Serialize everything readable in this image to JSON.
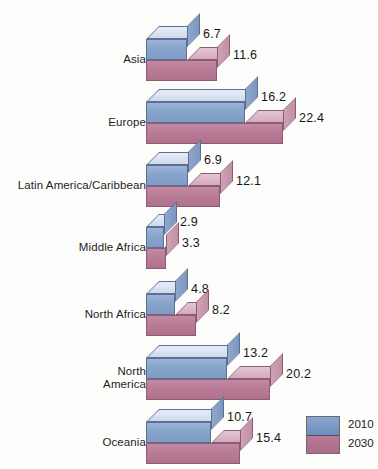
{
  "chart_data": {
    "type": "bar",
    "orientation": "horizontal",
    "title": "",
    "xlabel": "",
    "ylabel": "",
    "grid": false,
    "legend_position": "bottom-right",
    "categories": [
      "Asia",
      "Europe",
      "Latin America/Caribbean",
      "Middle Africa",
      "North Africa",
      "North\nAmerica",
      "Oceania"
    ],
    "series": [
      {
        "name": "2010",
        "color": "#7f9bc5",
        "values": [
          6.7,
          16.2,
          6.9,
          2.9,
          4.8,
          13.2,
          10.7
        ]
      },
      {
        "name": "2030",
        "color": "#b0718c",
        "values": [
          11.6,
          22.4,
          12.1,
          3.3,
          8.2,
          20.2,
          15.4
        ]
      }
    ],
    "xlim": [
      0,
      22.4
    ]
  },
  "legend": {
    "items": [
      {
        "label": "2010",
        "color": "#7f9bc5"
      },
      {
        "label": "2030",
        "color": "#b0718c"
      }
    ]
  },
  "groups": [
    {
      "label": "Asia",
      "v2010": "6.7",
      "v2030": "11.6"
    },
    {
      "label": "Europe",
      "v2010": "16.2",
      "v2030": "22.4"
    },
    {
      "label": "Latin America/Caribbean",
      "v2010": "6.9",
      "v2030": "12.1"
    },
    {
      "label": "Middle Africa",
      "v2010": "2.9",
      "v2030": "3.3"
    },
    {
      "label": "North Africa",
      "v2010": "4.8",
      "v2030": "8.2"
    },
    {
      "label": "North\nAmerica",
      "v2010": "13.2",
      "v2030": "20.2"
    },
    {
      "label": "Oceania",
      "v2010": "10.7",
      "v2030": "15.4"
    }
  ]
}
